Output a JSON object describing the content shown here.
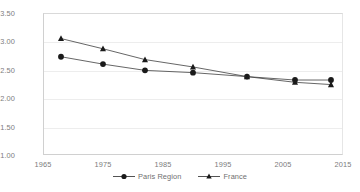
{
  "chart_data": {
    "type": "line",
    "title": "",
    "subtitle": "",
    "xlabel": "",
    "ylabel": "",
    "x": [
      1968,
      1975,
      1982,
      1990,
      1999,
      2007,
      2013
    ],
    "xlim": [
      1965,
      2015
    ],
    "ylim": [
      1.0,
      3.5
    ],
    "grid": true,
    "legend_position": "bottom",
    "xticks": [
      "1965",
      "1975",
      "1985",
      "1995",
      "2005",
      "2015"
    ],
    "xtick_values": [
      1965,
      1975,
      1985,
      1995,
      2005,
      2015
    ],
    "yticks": [
      "1.00",
      "1.50",
      "2.00",
      "2.50",
      "3.00",
      "3.50"
    ],
    "ytick_values": [
      1.0,
      1.5,
      2.0,
      2.5,
      3.0,
      3.5
    ],
    "series": [
      {
        "name": "Paris Region",
        "marker": "circle",
        "color": "#1a1a1a",
        "values": [
          2.73,
          2.6,
          2.49,
          2.45,
          2.38,
          2.32,
          2.32
        ]
      },
      {
        "name": "France",
        "marker": "triangle",
        "color": "#1a1a1a",
        "values": [
          3.05,
          2.87,
          2.68,
          2.55,
          2.38,
          2.28,
          2.24
        ]
      }
    ]
  },
  "legend": {
    "items": [
      {
        "label": "Paris Region",
        "marker": "circle-marker-icon"
      },
      {
        "label": "France",
        "marker": "triangle-marker-icon"
      }
    ]
  },
  "colors": {
    "series": "#1a1a1a",
    "line": "#3f3f3f",
    "gridline": "#ededed",
    "axis": "#d0d0d0",
    "tick_text": "#7d7d7d",
    "background": "#ffffff"
  }
}
